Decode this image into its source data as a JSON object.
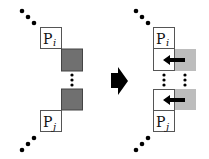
{
  "diagram": {
    "before": {
      "top_box": {
        "label": "P",
        "subscript": "i"
      },
      "bottom_box": {
        "label": "P",
        "subscript": "j"
      },
      "blocks": [
        "dark-square",
        "dark-square"
      ]
    },
    "after": {
      "top_box": {
        "label": "P",
        "subscript": "i"
      },
      "bottom_box": {
        "label": "P",
        "subscript": "j"
      },
      "blocks": [
        "light-square-with-left-arrow",
        "light-square-with-left-arrow"
      ]
    },
    "transition": "right-arrow",
    "colors": {
      "dark_block": "#707070",
      "light_block": "#bdbdbd",
      "border": "#555555",
      "ink": "#000000"
    }
  }
}
